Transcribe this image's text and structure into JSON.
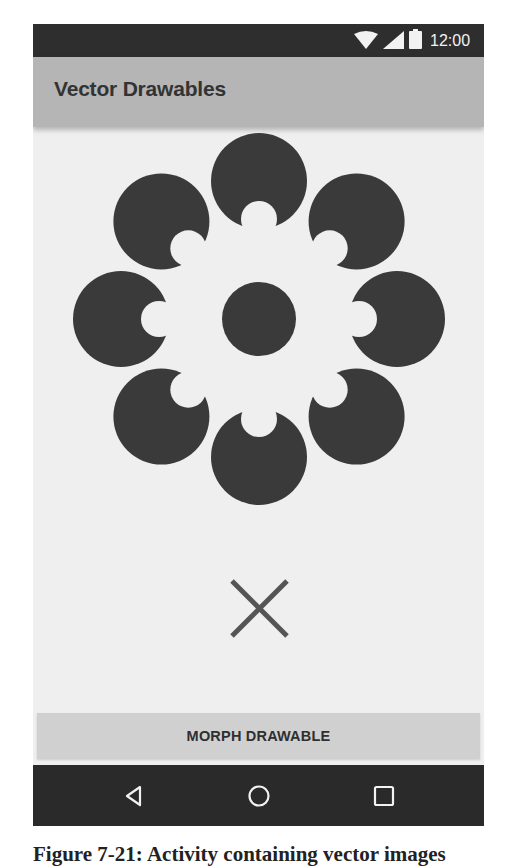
{
  "status_bar": {
    "time": "12:00",
    "icons": [
      "wifi-icon",
      "signal-icon",
      "battery-icon"
    ]
  },
  "app_bar": {
    "title": "Vector Drawables"
  },
  "content": {
    "flower_drawable": {
      "name": "flower-vector-drawable",
      "color": "#3a3a3a",
      "petal_count": 8
    },
    "close_drawable": {
      "name": "x-vector-drawable",
      "color": "#555555"
    },
    "morph_button_label": "MORPH DRAWABLE"
  },
  "nav_bar": {
    "buttons": [
      "back",
      "home",
      "recents"
    ]
  },
  "caption": "Figure 7-21: Activity containing vector images"
}
